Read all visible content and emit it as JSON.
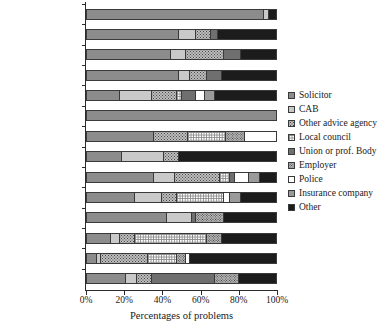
{
  "chart_data": {
    "type": "bar",
    "orientation": "horizontal",
    "stacked": true,
    "title": "",
    "xlabel": "Percentages of problems",
    "ylabel": "",
    "xlim": [
      0,
      100
    ],
    "xticks": [
      "0%",
      "20%",
      "40%",
      "60%",
      "80%",
      "100%"
    ],
    "xtick_values": [
      0,
      20,
      40,
      60,
      80,
      100
    ],
    "grid": false,
    "legend_position": "right",
    "categories": [
      "Divorce",
      "R'ship. breakdown",
      "Housing (own)",
      "Personal injury",
      "Money / debt",
      "Homelessness",
      "Domestic violence",
      "Clinical negligence",
      "Consumer",
      "Housing (rent)",
      "Employment",
      "Welfare benefits",
      "Children",
      "Discrimination"
    ],
    "series": [
      {
        "name": "Solicitor",
        "fill": "f-solicitor",
        "values": [
          93,
          48,
          44,
          48,
          17,
          100,
          35,
          18,
          35,
          25,
          42,
          12,
          5,
          20
        ]
      },
      {
        "name": "CAB",
        "fill": "f-cab",
        "values": [
          3,
          9,
          8,
          6,
          17,
          0,
          0,
          22,
          11,
          14,
          13,
          5,
          2,
          6
        ]
      },
      {
        "name": "Other advice agency",
        "fill": "f-otheradv",
        "values": [
          0,
          8,
          20,
          9,
          13,
          0,
          18,
          8,
          24,
          8,
          0,
          8,
          25,
          8
        ]
      },
      {
        "name": "Local council",
        "fill": "f-council",
        "values": [
          0,
          0,
          0,
          0,
          3,
          0,
          20,
          0,
          5,
          25,
          0,
          38,
          15,
          0
        ]
      },
      {
        "name": "Union or prof. Body",
        "fill": "f-union",
        "values": [
          0,
          4,
          9,
          8,
          7,
          0,
          0,
          0,
          3,
          0,
          2,
          0,
          0,
          33
        ]
      },
      {
        "name": "Employer",
        "fill": "f-employer",
        "values": [
          0,
          0,
          0,
          0,
          0,
          0,
          10,
          0,
          0,
          0,
          15,
          8,
          5,
          13
        ]
      },
      {
        "name": "Police",
        "fill": "f-police",
        "values": [
          0,
          0,
          0,
          0,
          5,
          0,
          17,
          0,
          7,
          3,
          0,
          0,
          2,
          0
        ]
      },
      {
        "name": "Insurance company",
        "fill": "f-insurance",
        "values": [
          0,
          0,
          0,
          0,
          5,
          0,
          0,
          0,
          6,
          6,
          0,
          0,
          0,
          0
        ]
      },
      {
        "name": "Other",
        "fill": "f-other",
        "values": [
          4,
          31,
          19,
          29,
          33,
          0,
          0,
          52,
          9,
          19,
          28,
          29,
          46,
          20
        ]
      }
    ]
  }
}
